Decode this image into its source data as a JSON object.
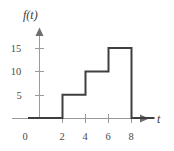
{
  "figure": {
    "background_color": "#ffffff",
    "curve_color": "#3f3f3f",
    "axis_color": "#6e6e6e",
    "tick_color": "#9a9a9a",
    "text_color": "#3f3f3f"
  },
  "chart_data": {
    "type": "line",
    "title": "",
    "xlabel": "t",
    "ylabel": "f(t)",
    "xlim": [
      -1,
      10
    ],
    "ylim": [
      0,
      17
    ],
    "grid": false,
    "legend": null,
    "x_ticks": [
      0,
      2,
      4,
      6,
      8
    ],
    "x_tick_labels": [
      "0",
      "2",
      "4",
      "6",
      "8"
    ],
    "y_ticks": [
      5,
      10,
      15
    ],
    "y_tick_labels": [
      "5",
      "10",
      "15"
    ],
    "series": [
      {
        "name": "f(t)",
        "style": "step-post",
        "segments": [
          {
            "t_start": -1,
            "t_end": 2,
            "value": 0
          },
          {
            "t_start": 2,
            "t_end": 4,
            "value": 5
          },
          {
            "t_start": 4,
            "t_end": 6,
            "value": 10
          },
          {
            "t_start": 6,
            "t_end": 8,
            "value": 15
          },
          {
            "t_start": 8,
            "t_end": 10,
            "value": 0
          }
        ],
        "x": [
          -1,
          2,
          2,
          4,
          4,
          6,
          6,
          8,
          8,
          10
        ],
        "values": [
          0,
          0,
          5,
          5,
          10,
          10,
          15,
          15,
          0,
          0
        ]
      }
    ]
  },
  "labels": {
    "y_axis": "f(t)",
    "x_axis": "t",
    "origin": "0",
    "x_2": "2",
    "x_4": "4",
    "x_6": "6",
    "x_8": "8",
    "y_5": "5",
    "y_10": "10",
    "y_15": "15"
  }
}
